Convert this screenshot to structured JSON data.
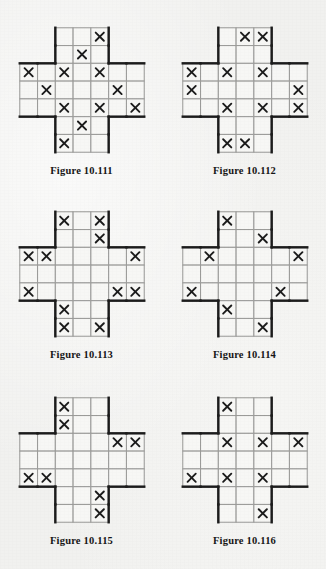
{
  "page": {
    "background_color": "#f1f1ef",
    "width": 326,
    "height": 569,
    "shape": "greek-cross",
    "grid_size": 7,
    "corner_notch": 2,
    "mark_glyph": "✖",
    "colors": {
      "outline": "#1a1a1a",
      "gridline": "#9a9a98",
      "mark": "#1a1a1a",
      "cell_fill": "#f7f7f5"
    }
  },
  "figures": [
    {
      "id": "fig-10-111",
      "caption": "Figure 10.111",
      "marks": [
        [
          0,
          4
        ],
        [
          1,
          3
        ],
        [
          2,
          0
        ],
        [
          2,
          2
        ],
        [
          2,
          4
        ],
        [
          3,
          1
        ],
        [
          3,
          5
        ],
        [
          4,
          2
        ],
        [
          4,
          4
        ],
        [
          4,
          6
        ],
        [
          5,
          3
        ],
        [
          6,
          2
        ]
      ]
    },
    {
      "id": "fig-10-112",
      "caption": "Figure 10.112",
      "marks": [
        [
          0,
          3
        ],
        [
          0,
          4
        ],
        [
          2,
          0
        ],
        [
          2,
          2
        ],
        [
          2,
          4
        ],
        [
          3,
          0
        ],
        [
          3,
          6
        ],
        [
          4,
          2
        ],
        [
          4,
          4
        ],
        [
          4,
          6
        ],
        [
          6,
          2
        ],
        [
          6,
          3
        ]
      ]
    },
    {
      "id": "fig-10-113",
      "caption": "Figure 10.113",
      "marks": [
        [
          0,
          2
        ],
        [
          0,
          4
        ],
        [
          1,
          4
        ],
        [
          2,
          0
        ],
        [
          2,
          1
        ],
        [
          2,
          6
        ],
        [
          4,
          0
        ],
        [
          4,
          5
        ],
        [
          4,
          6
        ],
        [
          5,
          2
        ],
        [
          6,
          2
        ],
        [
          6,
          4
        ]
      ]
    },
    {
      "id": "fig-10-114",
      "caption": "Figure 10.114",
      "marks": [
        [
          0,
          2
        ],
        [
          1,
          4
        ],
        [
          2,
          1
        ],
        [
          2,
          6
        ],
        [
          4,
          0
        ],
        [
          4,
          5
        ],
        [
          5,
          2
        ],
        [
          6,
          4
        ]
      ]
    },
    {
      "id": "fig-10-115",
      "caption": "Figure 10.115",
      "marks": [
        [
          0,
          2
        ],
        [
          1,
          2
        ],
        [
          2,
          5
        ],
        [
          2,
          6
        ],
        [
          4,
          0
        ],
        [
          4,
          1
        ],
        [
          5,
          4
        ],
        [
          6,
          4
        ]
      ]
    },
    {
      "id": "fig-10-116",
      "caption": "Figure 10.116",
      "marks": [
        [
          0,
          2
        ],
        [
          2,
          2
        ],
        [
          2,
          4
        ],
        [
          2,
          6
        ],
        [
          4,
          0
        ],
        [
          4,
          2
        ],
        [
          4,
          4
        ],
        [
          6,
          4
        ]
      ]
    }
  ]
}
